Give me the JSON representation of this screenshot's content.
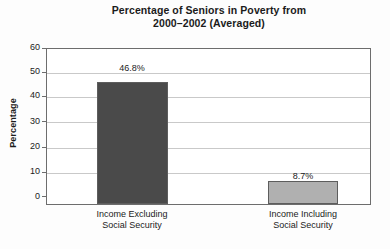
{
  "chart_data": {
    "type": "bar",
    "title": "Percentage of Seniors in Poverty from 2000–2002 (Averaged)",
    "title_line1": "Percentage of Seniors in Poverty from",
    "title_line2": "2000–2002 (Averaged)",
    "xlabel": "",
    "ylabel": "Percentage",
    "ylim": [
      0,
      60
    ],
    "ytick_labels": [
      "60",
      "50",
      "40",
      "30",
      "20",
      "10",
      "0"
    ],
    "ytick_values": [
      60,
      50,
      40,
      30,
      20,
      10,
      0
    ],
    "grid": true,
    "legend": "none",
    "categories": [
      "Income Excluding Social Security",
      "Income Including Social Security"
    ],
    "category_lines": [
      {
        "line1": "Income Excluding",
        "line2": "Social Security"
      },
      {
        "line1": "Income Including",
        "line2": "Social Security"
      }
    ],
    "values": [
      46.8,
      8.7
    ],
    "value_labels": [
      "46.8%",
      "8.7%"
    ],
    "bar_colors": [
      "#4a4a4a",
      "#b0b0b0"
    ]
  },
  "colors": {
    "background": "#fdfdfd",
    "plot_background": "#ffffff",
    "axis": "#6d6d6d",
    "gridline": "#c9c9c9",
    "text": "#1b1b1b",
    "bar_dark": "#4a4a4a",
    "bar_light": "#b0b0b0"
  }
}
